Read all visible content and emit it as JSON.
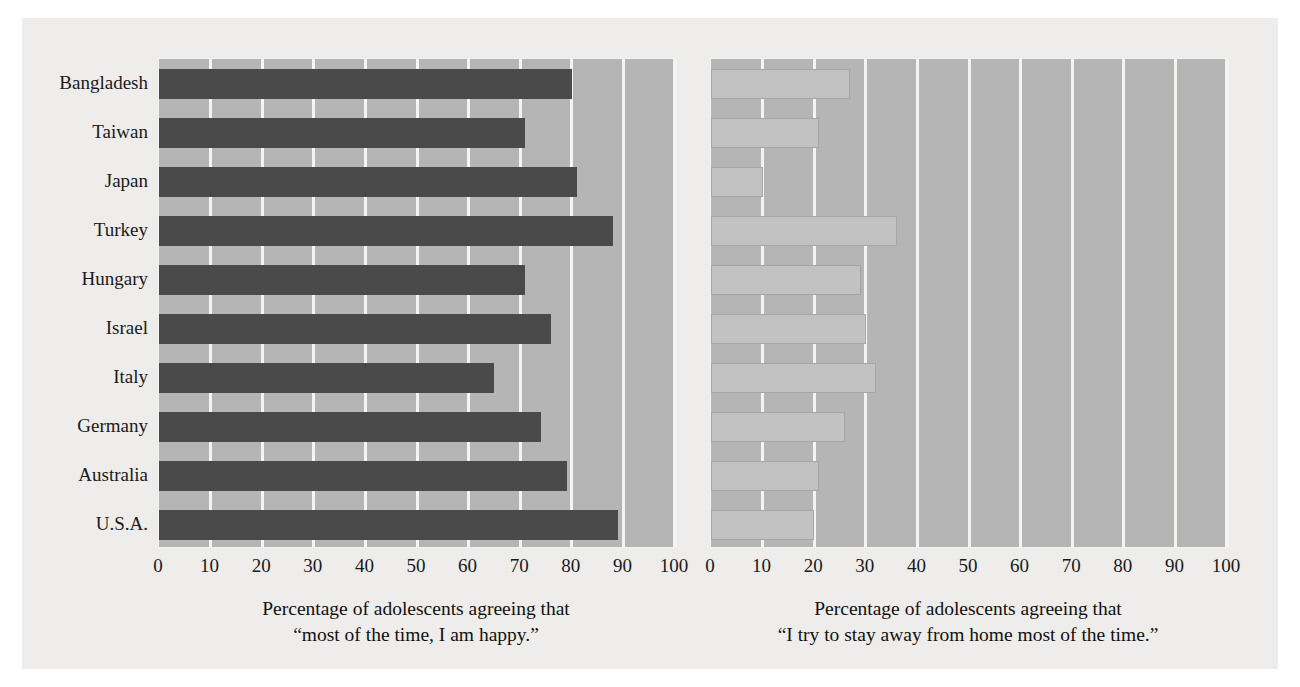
{
  "chart_data": [
    {
      "type": "bar",
      "orientation": "horizontal",
      "panel": "left",
      "title": "",
      "xlabel": "Percentage of adolescents agreeing that “most of the time, I am happy.”",
      "xlabel_line1": "Percentage of adolescents agreeing that",
      "xlabel_line2": "“most of the time, I am happy.”",
      "ylabel": "",
      "xlim": [
        0,
        100
      ],
      "xticks": [
        0,
        10,
        20,
        30,
        40,
        50,
        60,
        70,
        80,
        90,
        100
      ],
      "grid": true,
      "legend": "none",
      "bar_color": "#4a4a4a",
      "plot_background": "#b5b5b5",
      "categories": [
        "Bangladesh",
        "Taiwan",
        "Japan",
        "Turkey",
        "Hungary",
        "Israel",
        "Italy",
        "Germany",
        "Australia",
        "U.S.A."
      ],
      "values": [
        80,
        71,
        81,
        88,
        71,
        76,
        65,
        74,
        79,
        89
      ]
    },
    {
      "type": "bar",
      "orientation": "horizontal",
      "panel": "right",
      "title": "",
      "xlabel": "Percentage of adolescents agreeing that “I try to stay away from home most of the time.”",
      "xlabel_line1": "Percentage of adolescents agreeing that",
      "xlabel_line2": "“I try to stay away from home most of the time.”",
      "ylabel": "",
      "xlim": [
        0,
        100
      ],
      "xticks": [
        0,
        10,
        20,
        30,
        40,
        50,
        60,
        70,
        80,
        90,
        100
      ],
      "grid": true,
      "legend": "none",
      "bar_color": "#c2c2c2",
      "plot_background": "#b5b5b5",
      "categories": [
        "Bangladesh",
        "Taiwan",
        "Japan",
        "Turkey",
        "Hungary",
        "Israel",
        "Italy",
        "Germany",
        "Australia",
        "U.S.A."
      ],
      "values": [
        27,
        21,
        10,
        36,
        29,
        30,
        32,
        26,
        21,
        20
      ]
    }
  ],
  "figure": {
    "background": "#eeedeb",
    "page_background": "#ffffff",
    "grid_color": "#f4f4f2",
    "text_color": "#1a1a1a"
  }
}
